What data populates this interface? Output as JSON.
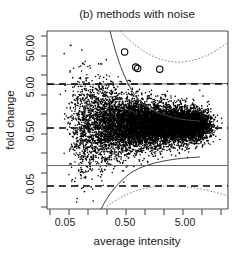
{
  "chart_data": {
    "type": "scatter",
    "title": "(b) methods with noise",
    "xlabel": "average intensity",
    "ylabel": "fold change",
    "xscale": "log",
    "yscale": "log",
    "xlim": [
      0.02,
      30
    ],
    "ylim": [
      0.018,
      90
    ],
    "grid": false,
    "legend": null,
    "x_tick_labels": [
      "0.05",
      "0.50",
      "5.00"
    ],
    "x_tick_values": [
      0.05,
      0.5,
      5.0
    ],
    "x_minor_tick_count": 10,
    "y_tick_labels": [
      "50.00",
      "5.00",
      "0.50",
      "0.05"
    ],
    "y_tick_values": [
      50.0,
      5.0,
      0.5,
      0.05
    ],
    "y_minor_tick_count": 10,
    "point_count_approx": 7000,
    "point_color": "#000000",
    "point_size_px": 1.6,
    "reference_lines": [
      {
        "name": "upper-agreement-limit",
        "style": "dashed",
        "y_value": 4.5
      },
      {
        "name": "mean-bias-line",
        "style": "dashed",
        "y_value": 1.0
      },
      {
        "name": "lower-agreement-limit",
        "style": "dashed",
        "y_value": 0.12
      },
      {
        "name": "upper-solid-limit",
        "style": "solid",
        "y_value": 5.4
      },
      {
        "name": "lower-solid-limit",
        "style": "solid",
        "y_value": 0.2
      }
    ],
    "confidence_bands": [
      {
        "name": "upper-band-dotted",
        "style": "dotted"
      },
      {
        "name": "lower-band-dotted",
        "style": "dotted"
      },
      {
        "name": "left-steep-band",
        "style": "solid"
      }
    ],
    "outliers": [
      {
        "x": 0.46,
        "y": 33.0
      },
      {
        "x": 0.72,
        "y": 16.0
      },
      {
        "x": 0.78,
        "y": 15.0
      },
      {
        "x": 1.9,
        "y": 14.5
      }
    ],
    "outlier_marker": "open-circle",
    "outlier_radius_px": 3.2
  },
  "axes": {
    "title": "(b) methods with noise",
    "x_title": "average intensity",
    "y_title": "fold change"
  }
}
